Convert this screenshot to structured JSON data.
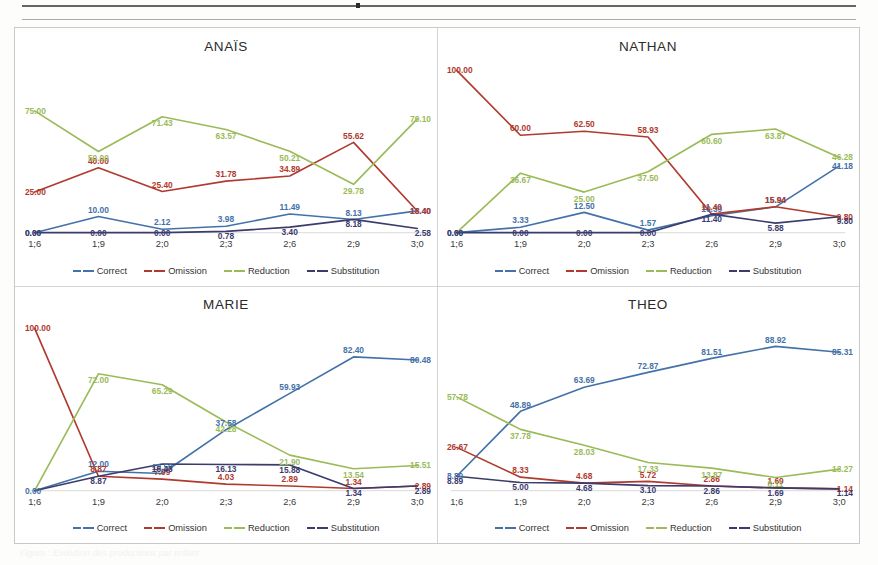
{
  "page": {
    "background_color": "#ffffff",
    "caption_faint": "Figure : Evolution des productions par enfant"
  },
  "figure": {
    "layout": "2x2 grid of line charts",
    "frame_color": "#c9c9c9"
  },
  "legend": {
    "items": [
      {
        "label": "Correct",
        "color": "#4472a8"
      },
      {
        "label": "Omission",
        "color": "#b03a2e"
      },
      {
        "label": "Reduction",
        "color": "#9bbb59"
      },
      {
        "label": "Substitution",
        "color": "#3b3b6d"
      }
    ]
  },
  "series_colors": {
    "Correct": "#4472a8",
    "Omission": "#b03a2e",
    "Reduction": "#9bbb59",
    "Substitution": "#3b3b6d"
  },
  "chart_data": [
    {
      "type": "line",
      "title": "ANAÏS",
      "xlabel": "",
      "ylabel": "",
      "categories": [
        "1;6",
        "1;9",
        "2;0",
        "2;3",
        "2;6",
        "2;9",
        "3;0"
      ],
      "ylim": [
        0,
        100
      ],
      "grid": false,
      "legend_position": "bottom",
      "data_labels": true,
      "series": [
        {
          "name": "Correct",
          "color": "#4472a8",
          "values": [
            0.0,
            10.0,
            2.12,
            3.98,
            11.49,
            8.13,
            13.4
          ]
        },
        {
          "name": "Omission",
          "color": "#b03a2e",
          "values": [
            25.0,
            40.0,
            25.4,
            31.78,
            34.89,
            55.62,
            13.4
          ]
        },
        {
          "name": "Reduction",
          "color": "#9bbb59",
          "values": [
            75.0,
            50.0,
            71.43,
            63.57,
            50.21,
            29.78,
            70.1
          ]
        },
        {
          "name": "Substitution",
          "color": "#3b3b6d",
          "values": [
            0.0,
            0.0,
            0.0,
            0.78,
            3.4,
            8.18,
            2.58
          ]
        }
      ]
    },
    {
      "type": "line",
      "title": "NATHAN",
      "xlabel": "",
      "ylabel": "",
      "categories": [
        "1;6",
        "1;9",
        "2;0",
        "2;3",
        "2;6",
        "2;9",
        "3;0"
      ],
      "ylim": [
        0,
        100
      ],
      "grid": false,
      "legend_position": "bottom",
      "data_labels": true,
      "series": [
        {
          "name": "Correct",
          "color": "#4472a8",
          "values": [
            0.0,
            3.33,
            12.5,
            1.57,
            10.39,
            15.94,
            41.18
          ]
        },
        {
          "name": "Omission",
          "color": "#b03a2e",
          "values": [
            100.0,
            60.0,
            62.5,
            58.93,
            11.4,
            15.94,
            9.8
          ]
        },
        {
          "name": "Reduction",
          "color": "#9bbb59",
          "values": [
            0.0,
            36.67,
            25.0,
            37.5,
            60.6,
            63.87,
            46.28
          ]
        },
        {
          "name": "Substitution",
          "color": "#3b3b6d",
          "values": [
            0.0,
            0.0,
            0.0,
            0.0,
            11.4,
            5.88,
            9.8
          ]
        }
      ]
    },
    {
      "type": "line",
      "title": "MARIE",
      "xlabel": "",
      "ylabel": "",
      "categories": [
        "1;6",
        "1;9",
        "2;0",
        "2;3",
        "2;6",
        "2;9",
        "3;0"
      ],
      "ylim": [
        0,
        100
      ],
      "grid": false,
      "legend_position": "bottom",
      "data_labels": true,
      "series": [
        {
          "name": "Correct",
          "color": "#4472a8",
          "values": [
            0.0,
            12.0,
            10.59,
            37.58,
            59.93,
            82.4,
            80.48
          ]
        },
        {
          "name": "Omission",
          "color": "#b03a2e",
          "values": [
            100.0,
            8.87,
            7.09,
            4.03,
            2.89,
            1.34,
            2.89
          ]
        },
        {
          "name": "Reduction",
          "color": "#9bbb59",
          "values": [
            0.0,
            72.0,
            65.29,
            42.28,
            21.9,
            13.54,
            15.51
          ]
        },
        {
          "name": "Substitution",
          "color": "#3b3b6d",
          "values": [
            0.0,
            8.87,
            16.43,
            16.13,
            15.88,
            1.34,
            2.89
          ]
        }
      ]
    },
    {
      "type": "line",
      "title": "THEO",
      "xlabel": "",
      "ylabel": "",
      "categories": [
        "1;6",
        "1;9",
        "2;0",
        "2;3",
        "2;6",
        "2;9",
        "3;0"
      ],
      "ylim": [
        0,
        100
      ],
      "grid": false,
      "legend_position": "bottom",
      "data_labels": true,
      "series": [
        {
          "name": "Correct",
          "color": "#4472a8",
          "values": [
            8.89,
            48.89,
            63.69,
            72.87,
            81.51,
            88.92,
            85.31
          ]
        },
        {
          "name": "Omission",
          "color": "#b03a2e",
          "values": [
            26.67,
            8.33,
            4.68,
            5.72,
            2.86,
            1.69,
            1.14
          ]
        },
        {
          "name": "Reduction",
          "color": "#9bbb59",
          "values": [
            57.78,
            37.78,
            28.03,
            17.33,
            13.87,
            8.11,
            13.27
          ]
        },
        {
          "name": "Substitution",
          "color": "#3b3b6d",
          "values": [
            8.89,
            5.0,
            4.68,
            3.1,
            2.86,
            1.69,
            1.14
          ]
        }
      ]
    }
  ],
  "axis": {
    "tick_labels": [
      "1;6",
      "1;9",
      "2;0",
      "2;3",
      "2;6",
      "2;9",
      "3;0"
    ]
  },
  "label_overrides": {
    "ANAÏS": {
      "Correct": [
        "0.00",
        "10.00",
        "2.12",
        "3.98",
        "11.49",
        "8.13",
        "13.40"
      ],
      "Omission": [
        "25.00",
        "40.00",
        "25.40",
        "31.78",
        "34.89",
        "55.62",
        "13.40"
      ],
      "Reduction": [
        "75.00",
        "50.00",
        "71.43",
        "63.57",
        "50.21",
        "29.78",
        "70.10"
      ],
      "Substitution": [
        "0.00",
        "0.00",
        "0.00",
        "0.78",
        "3.40",
        "8.18",
        "2.58"
      ]
    },
    "NATHAN": {
      "Correct": [
        "0.00",
        "3.33",
        "12.50",
        "1.57",
        "10.39",
        "15.94",
        "41.18"
      ],
      "Omission": [
        "100.00",
        "60.00",
        "62.50",
        "58.93",
        "11.40",
        "15.94",
        "9.80"
      ],
      "Reduction": [
        "",
        "36.67",
        "25.00",
        "37.50",
        "60.60",
        "63.87",
        "46.28"
      ],
      "Substitution": [
        "0.00",
        "0.00",
        "0.00",
        "0.00",
        "11.40",
        "5.88",
        "9.80"
      ]
    },
    "MARIE": {
      "Correct": [
        "0.00",
        "12.00",
        "10.59",
        "37.58",
        "59.93",
        "82.40",
        "80.48"
      ],
      "Omission": [
        "100.00",
        "8.87",
        "7.09",
        "4.03",
        "2.89",
        "1.34",
        "2.89"
      ],
      "Reduction": [
        "",
        "72.00",
        "65.29",
        "42.28",
        "21.90",
        "13.54",
        "15.51"
      ],
      "Substitution": [
        "",
        "8.87",
        "16.43",
        "16.13",
        "15.88",
        "1.34",
        "2.89"
      ]
    },
    "THEO": {
      "Correct": [
        "8.89",
        "48.89",
        "63.69",
        "72.87",
        "81.51",
        "88.92",
        "85.31"
      ],
      "Omission": [
        "26.67",
        "8.33",
        "4.68",
        "5.72",
        "2.86",
        "1.69",
        "1.14"
      ],
      "Reduction": [
        "57.78",
        "37.78",
        "28.03",
        "17.33",
        "13.87",
        "8.11",
        "13.27"
      ],
      "Substitution": [
        "8.89",
        "5.00",
        "4.68",
        "3.10",
        "2.86",
        "1.69",
        "1.14"
      ]
    }
  }
}
